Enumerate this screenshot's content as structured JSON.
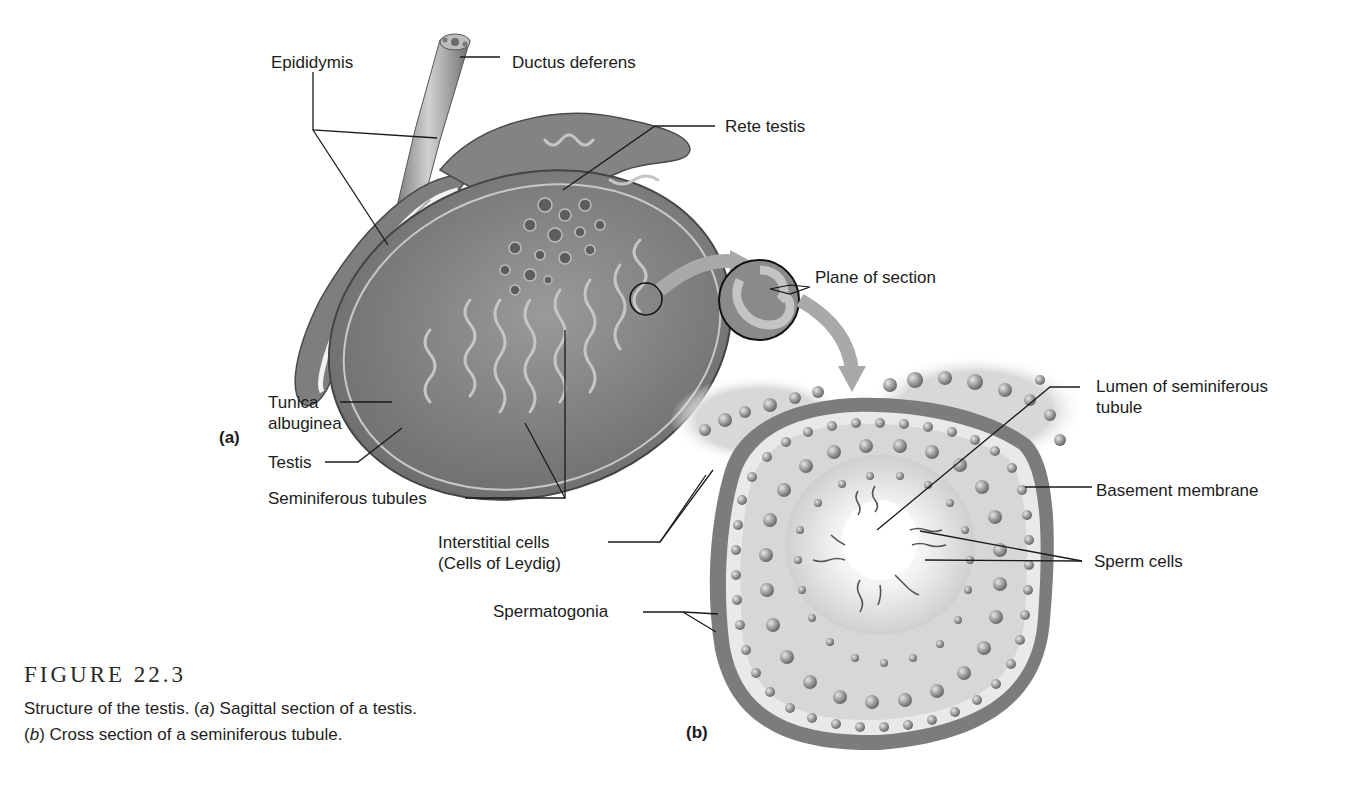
{
  "figure": {
    "number": "FIGURE 22.3",
    "caption_line1": {
      "pre": "Structure of the testis. (",
      "italic": "a",
      "post": ") Sagittal section of a testis."
    },
    "caption_line2": {
      "pre": "(",
      "italic": "b",
      "post": ") Cross section of a seminiferous tubule."
    }
  },
  "panels": {
    "a": "(a)",
    "b": "(b)"
  },
  "labels_a": {
    "epididymis": "Epididymis",
    "ductus_deferens": "Ductus deferens",
    "rete_testis": "Rete testis",
    "tunica_line1": "Tunica",
    "tunica_line2": "albuginea",
    "testis": "Testis",
    "seminiferous_tubules": "Seminiferous tubules",
    "plane_of_section": "Plane of section"
  },
  "labels_b": {
    "lumen_line1": "Lumen of seminiferous",
    "lumen_line2": "tubule",
    "basement_membrane": "Basement membrane",
    "sperm_cells": "Sperm cells",
    "interstitial_line1": "Interstitial cells",
    "interstitial_line2": "(Cells of Leydig)",
    "spermatogonia": "Spermatogonia"
  },
  "colors": {
    "tissue_dark": "#6e6e6e",
    "tissue_mid": "#8c8c8c",
    "tissue_light": "#b4b4b4",
    "arrow": "#a9a9a9",
    "leader_line": "#1a1a1a"
  }
}
